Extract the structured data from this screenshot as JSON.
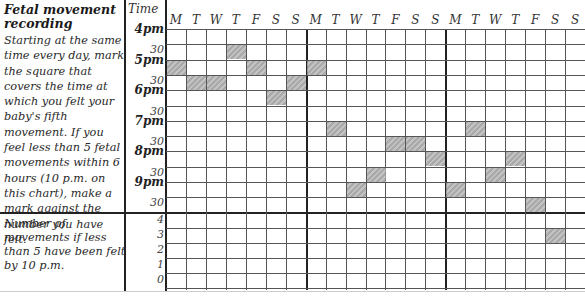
{
  "title": "Fetal movement recording",
  "instructions": "Starting at the same time every day, mark the square that covers the time at which you felt your baby's fifth movement. If you feel less than 5 fetal movements within 6 hours (10 p.m. on this chart), make a mark against the number you have felt.",
  "count_instructions": "Number of movements if less than 5 have been felt by 10 p.m.",
  "time_header": "Time",
  "time_labels": [
    "4pm",
    "30",
    "5pm",
    "30",
    "6pm",
    "30",
    "7pm",
    "30",
    "8pm",
    "30",
    "9pm",
    "30"
  ],
  "count_labels": [
    "4",
    "3",
    "2",
    "1",
    "0"
  ],
  "days": [
    "M",
    "T",
    "W",
    "T",
    "F",
    "S",
    "S",
    "M",
    "T",
    "W",
    "T",
    "F",
    "S",
    "S",
    "M",
    "T",
    "W",
    "T",
    "F",
    "S",
    "S"
  ],
  "chart_data": {
    "type": "table",
    "title": "Fetal movement recording",
    "columns": [
      "Week1 M",
      "Week1 T",
      "Week1 W",
      "Week1 T",
      "Week1 F",
      "Week1 S",
      "Week1 S",
      "Week2 M",
      "Week2 T",
      "Week2 W",
      "Week2 T",
      "Week2 F",
      "Week2 S",
      "Week2 S",
      "Week3 M",
      "Week3 T",
      "Week3 W",
      "Week3 T",
      "Week3 F",
      "Week3 S",
      "Week3 S"
    ],
    "rows_time": [
      "4:00",
      "4:30",
      "5:00",
      "5:30",
      "6:00",
      "6:30",
      "7:00",
      "7:30",
      "8:00",
      "8:30",
      "9:00",
      "9:30"
    ],
    "rows_count": [
      "4",
      "3",
      "2",
      "1",
      "0"
    ],
    "fifth_movement_marks": [
      {
        "day_index": 0,
        "day": "M",
        "time": "5:00"
      },
      {
        "day_index": 1,
        "day": "T",
        "time": "5:30"
      },
      {
        "day_index": 2,
        "day": "W",
        "time": "5:30"
      },
      {
        "day_index": 3,
        "day": "T",
        "time": "4:30"
      },
      {
        "day_index": 4,
        "day": "F",
        "time": "5:00"
      },
      {
        "day_index": 5,
        "day": "S",
        "time": "6:00"
      },
      {
        "day_index": 6,
        "day": "S",
        "time": "5:30"
      },
      {
        "day_index": 7,
        "day": "M",
        "time": "5:00"
      },
      {
        "day_index": 8,
        "day": "T",
        "time": "7:00"
      },
      {
        "day_index": 9,
        "day": "W",
        "time": "9:00"
      },
      {
        "day_index": 10,
        "day": "T",
        "time": "8:30"
      },
      {
        "day_index": 11,
        "day": "F",
        "time": "7:30"
      },
      {
        "day_index": 12,
        "day": "S",
        "time": "7:30"
      },
      {
        "day_index": 13,
        "day": "S",
        "time": "8:00"
      },
      {
        "day_index": 14,
        "day": "M",
        "time": "9:00"
      },
      {
        "day_index": 15,
        "day": "T",
        "time": "7:00"
      },
      {
        "day_index": 16,
        "day": "W",
        "time": "8:30"
      },
      {
        "day_index": 17,
        "day": "T",
        "time": "8:00"
      },
      {
        "day_index": 18,
        "day": "F",
        "time": "9:30"
      }
    ],
    "count_marks": [
      {
        "day_index": 19,
        "day": "S",
        "count": 3
      }
    ],
    "grid": true
  },
  "marks_grid": [
    [
      0,
      2
    ],
    [
      1,
      3
    ],
    [
      2,
      3
    ],
    [
      3,
      1
    ],
    [
      4,
      2
    ],
    [
      5,
      4
    ],
    [
      6,
      3
    ],
    [
      7,
      2
    ],
    [
      8,
      6
    ],
    [
      9,
      10
    ],
    [
      10,
      9
    ],
    [
      11,
      7
    ],
    [
      12,
      7
    ],
    [
      13,
      8
    ],
    [
      14,
      10
    ],
    [
      15,
      6
    ],
    [
      16,
      9
    ],
    [
      17,
      8
    ],
    [
      18,
      11
    ],
    [
      19,
      13
    ]
  ]
}
